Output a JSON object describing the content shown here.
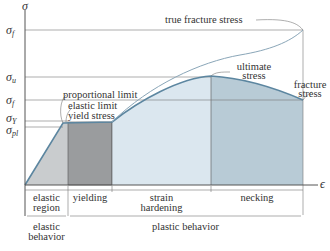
{
  "diagram": {
    "type": "stress-strain curve",
    "axes": {
      "y_symbol": "σ",
      "x_symbol": "ϵ"
    },
    "stress_levels": [
      {
        "id": "true_fracture",
        "symbol": "σ",
        "sub": "f",
        "prime": "′",
        "label": "true fracture stress"
      },
      {
        "id": "ultimate",
        "symbol": "σ",
        "sub": "u",
        "label": "ultimate stress"
      },
      {
        "id": "fracture",
        "symbol": "σ",
        "sub": "f",
        "label": "fracture stress"
      },
      {
        "id": "yield",
        "symbol": "σ",
        "sub": "Y",
        "label": "yield stress"
      },
      {
        "id": "proportional",
        "symbol": "σ",
        "sub": "pl",
        "label": "proportional limit"
      }
    ],
    "annotations": {
      "true_fracture": "true fracture stress",
      "ultimate_1": "ultimate",
      "ultimate_2": "stress",
      "fracture_1": "fracture",
      "fracture_2": "stress",
      "proportional": "proportional limit",
      "elastic_limit": "elastic limit",
      "yield": "yield stress"
    },
    "regions": [
      {
        "line1": "elastic",
        "line2": "region"
      },
      {
        "line1": "yielding",
        "line2": ""
      },
      {
        "line1": "strain",
        "line2": "hardening"
      },
      {
        "line1": "necking",
        "line2": ""
      }
    ],
    "behaviors": [
      {
        "line1": "elastic",
        "line2": "behavior"
      },
      {
        "line1": "plastic behavior",
        "line2": ""
      }
    ],
    "colors": {
      "elastic_fill": "#c9ccce",
      "yielding_fill": "#9a9c9e",
      "hardening_fill": "#dbe7ef",
      "necking_fill": "#b8cbd6",
      "curve": "#5c86a0",
      "axis": "#555555"
    }
  }
}
